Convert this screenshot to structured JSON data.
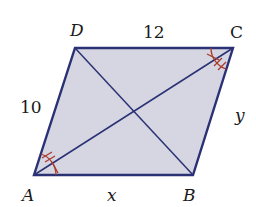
{
  "figure": {
    "type": "parallelogram",
    "vertices": {
      "A": {
        "label": "A",
        "x": 34,
        "y": 175
      },
      "B": {
        "label": "B",
        "x": 193,
        "y": 175
      },
      "C": {
        "label": "C",
        "x": 233,
        "y": 48
      },
      "D": {
        "label": "D",
        "x": 75,
        "y": 48
      }
    },
    "side_labels": {
      "DC": "12",
      "AD": "10",
      "AB": "x",
      "BC": "y"
    },
    "diagonals": [
      "AC",
      "BD"
    ],
    "angle_marks": {
      "A": {
        "upper": "double-tick",
        "lower": "single-tick"
      },
      "C": {
        "upper": "single-tick",
        "lower": "double-tick"
      }
    },
    "colors": {
      "fill": "#d6d6e2",
      "stroke": "#2a3275",
      "angle_mark": "#a83a2a",
      "text": "#1a1a1a"
    }
  }
}
